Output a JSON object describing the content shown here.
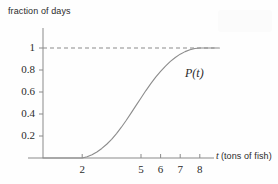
{
  "chart_data": {
    "type": "line",
    "title": "",
    "subtitle": "",
    "xlabel": "t (tons of fish)",
    "xlabel_symbol": "t",
    "xlabel_rest": "(tons of fish)",
    "ylabel": "fraction of days",
    "xlim": [
      0,
      9
    ],
    "ylim": [
      0,
      1.12
    ],
    "xticks": [
      2,
      5,
      6,
      7,
      8
    ],
    "xtick_labels": [
      "2",
      "5",
      "6",
      "7",
      "8"
    ],
    "yticks": [
      0.2,
      0.4,
      0.6,
      0.8,
      1
    ],
    "ytick_labels": [
      "0.2",
      "0.4",
      "0.6",
      "0.8",
      "1"
    ],
    "grid": false,
    "legend": "none",
    "annotations": [
      {
        "text": "P(t)",
        "x": 6.55,
        "y": 0.82
      }
    ],
    "reference_lines": [
      {
        "orientation": "horizontal",
        "y": 1,
        "style": "dashed",
        "x_from": 0,
        "x_to": 8.75,
        "label": "1"
      }
    ],
    "series": [
      {
        "name": "P(t)",
        "style": "solid",
        "color": "#8c8c8c",
        "x": [
          0.0,
          0.5,
          1.0,
          1.5,
          2.0,
          2.25,
          2.5,
          2.75,
          3.0,
          3.25,
          3.5,
          3.75,
          4.0,
          4.25,
          4.5,
          4.75,
          5.0,
          5.25,
          5.5,
          5.75,
          6.0,
          6.25,
          6.5,
          6.75,
          7.0,
          7.25,
          7.5,
          7.75,
          8.0,
          8.5,
          9.0
        ],
        "y": [
          0.0,
          0.0,
          0.0,
          0.0,
          0.0,
          0.012,
          0.03,
          0.055,
          0.087,
          0.125,
          0.17,
          0.222,
          0.28,
          0.343,
          0.41,
          0.478,
          0.546,
          0.613,
          0.676,
          0.735,
          0.788,
          0.836,
          0.878,
          0.914,
          0.944,
          0.967,
          0.984,
          0.995,
          1.0,
          1.0,
          1.0
        ]
      }
    ]
  },
  "labels": {
    "ylabel_title": "fraction of days",
    "xlabel_symbol": "t",
    "xlabel_rest": "(tons of fish)",
    "curve_label": "P(t)"
  },
  "colors": {
    "curve": "#8c8c8c",
    "axis": "#8a8a8a",
    "dashed": "#8a8a8a",
    "text": "#2b2b2b",
    "background": "#fefefe"
  }
}
